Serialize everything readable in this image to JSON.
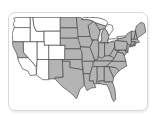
{
  "page": {
    "background": "#ffffff"
  },
  "card": {
    "type": "us-map-thumbnail",
    "background": "#ffffff",
    "border_color": "#d8d8d8"
  },
  "map": {
    "kind": "us-states-range-map",
    "colors": {
      "shaded": "#b4b4b4",
      "unshaded": "#ffffff",
      "water": "#ffffff",
      "border": "#4a4a4a"
    },
    "regions": [
      {
        "id": "wa",
        "name": "Washington",
        "fill": "unshaded"
      },
      {
        "id": "or",
        "name": "Oregon",
        "fill": "unshaded"
      },
      {
        "id": "id",
        "name": "Idaho",
        "fill": "unshaded"
      },
      {
        "id": "mt",
        "name": "Montana",
        "fill": "unshaded"
      },
      {
        "id": "wy",
        "name": "Wyoming",
        "fill": "unshaded"
      },
      {
        "id": "ca-n",
        "name": "California (northern)",
        "fill": "shaded"
      },
      {
        "id": "ca-s",
        "name": "California (southern)",
        "fill": "unshaded"
      },
      {
        "id": "nv",
        "name": "Nevada",
        "fill": "unshaded"
      },
      {
        "id": "ut",
        "name": "Utah",
        "fill": "unshaded"
      },
      {
        "id": "co",
        "name": "Colorado",
        "fill": "unshaded"
      },
      {
        "id": "az",
        "name": "Arizona",
        "fill": "unshaded"
      },
      {
        "id": "nm",
        "name": "New Mexico",
        "fill": "shaded"
      },
      {
        "id": "nd",
        "name": "North Dakota",
        "fill": "shaded"
      },
      {
        "id": "sd",
        "name": "South Dakota",
        "fill": "shaded"
      },
      {
        "id": "ne",
        "name": "Nebraska",
        "fill": "shaded"
      },
      {
        "id": "ks",
        "name": "Kansas",
        "fill": "shaded"
      },
      {
        "id": "ok",
        "name": "Oklahoma",
        "fill": "shaded"
      },
      {
        "id": "tx",
        "name": "Texas",
        "fill": "shaded"
      },
      {
        "id": "mn",
        "name": "Minnesota",
        "fill": "shaded"
      },
      {
        "id": "ia",
        "name": "Iowa",
        "fill": "shaded"
      },
      {
        "id": "mo",
        "name": "Missouri",
        "fill": "shaded"
      },
      {
        "id": "ar",
        "name": "Arkansas",
        "fill": "shaded"
      },
      {
        "id": "la",
        "name": "Louisiana",
        "fill": "shaded"
      },
      {
        "id": "wi",
        "name": "Wisconsin",
        "fill": "shaded"
      },
      {
        "id": "il",
        "name": "Illinois",
        "fill": "shaded"
      },
      {
        "id": "mi-up",
        "name": "Michigan (upper peninsula)",
        "fill": "shaded"
      },
      {
        "id": "mi-lp",
        "name": "Michigan (lower peninsula)",
        "fill": "shaded"
      },
      {
        "id": "in",
        "name": "Indiana",
        "fill": "shaded"
      },
      {
        "id": "oh",
        "name": "Ohio",
        "fill": "shaded"
      },
      {
        "id": "ky",
        "name": "Kentucky",
        "fill": "shaded"
      },
      {
        "id": "tn",
        "name": "Tennessee",
        "fill": "shaded"
      },
      {
        "id": "ms",
        "name": "Mississippi",
        "fill": "shaded"
      },
      {
        "id": "al",
        "name": "Alabama",
        "fill": "shaded"
      },
      {
        "id": "ga",
        "name": "Georgia",
        "fill": "shaded"
      },
      {
        "id": "fl",
        "name": "Florida",
        "fill": "shaded"
      },
      {
        "id": "sc",
        "name": "South Carolina",
        "fill": "shaded"
      },
      {
        "id": "nc",
        "name": "North Carolina",
        "fill": "shaded"
      },
      {
        "id": "va",
        "name": "Virginia",
        "fill": "shaded"
      },
      {
        "id": "wv",
        "name": "West Virginia",
        "fill": "shaded"
      },
      {
        "id": "md",
        "name": "Maryland",
        "fill": "shaded"
      },
      {
        "id": "de",
        "name": "Delaware",
        "fill": "shaded"
      },
      {
        "id": "pa",
        "name": "Pennsylvania",
        "fill": "shaded"
      },
      {
        "id": "nj",
        "name": "New Jersey",
        "fill": "shaded"
      },
      {
        "id": "ny",
        "name": "New York",
        "fill": "shaded"
      },
      {
        "id": "ny-li",
        "name": "Long Island",
        "fill": "shaded"
      },
      {
        "id": "vt",
        "name": "Vermont",
        "fill": "shaded"
      },
      {
        "id": "nh",
        "name": "New Hampshire",
        "fill": "shaded"
      },
      {
        "id": "me",
        "name": "Maine",
        "fill": "shaded"
      },
      {
        "id": "ma",
        "name": "Massachusetts",
        "fill": "shaded"
      },
      {
        "id": "ct",
        "name": "Connecticut",
        "fill": "shaded"
      },
      {
        "id": "ri",
        "name": "Rhode Island",
        "fill": "shaded"
      },
      {
        "id": "lake-superior",
        "name": "Lake Superior",
        "fill": "water"
      },
      {
        "id": "lake-michigan",
        "name": "Lake Michigan",
        "fill": "water"
      },
      {
        "id": "lake-huron",
        "name": "Lake Huron",
        "fill": "water"
      },
      {
        "id": "lake-erie",
        "name": "Lake Erie",
        "fill": "water"
      },
      {
        "id": "lake-ontario",
        "name": "Lake Ontario",
        "fill": "water"
      }
    ]
  }
}
